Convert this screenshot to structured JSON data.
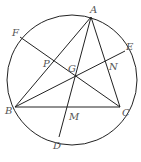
{
  "diagram": {
    "circle": {
      "cx": 72,
      "cy": 80,
      "r": 65
    },
    "points": {
      "A": {
        "label": "A",
        "x": 91,
        "y": 17,
        "lx": 90,
        "ly": 13
      },
      "B": {
        "label": "B",
        "x": 15,
        "y": 107,
        "lx": 5,
        "ly": 114
      },
      "C": {
        "label": "C",
        "x": 120,
        "y": 107,
        "lx": 122,
        "ly": 116
      },
      "D": {
        "label": "D",
        "x": 59,
        "y": 137,
        "lx": 53,
        "ly": 149
      },
      "E": {
        "label": "E",
        "x": 125,
        "y": 51,
        "lx": 126,
        "ly": 50
      },
      "F": {
        "label": "F",
        "x": 20,
        "y": 37,
        "lx": 12,
        "ly": 36
      },
      "G": {
        "label": "G",
        "x": 76,
        "y": 75,
        "lx": 68,
        "ly": 72
      },
      "M": {
        "label": "M",
        "x": 68,
        "y": 107,
        "lx": 69,
        "ly": 120
      },
      "N": {
        "label": "N",
        "x": 109,
        "y": 62,
        "lx": 109,
        "ly": 70
      },
      "P": {
        "label": "P",
        "x": 53,
        "y": 60,
        "lx": 43,
        "ly": 67
      }
    },
    "segments": [
      [
        "A",
        "B"
      ],
      [
        "A",
        "C"
      ],
      [
        "B",
        "C"
      ],
      [
        "A",
        "D"
      ],
      [
        "B",
        "E"
      ],
      [
        "F",
        "C"
      ]
    ]
  }
}
